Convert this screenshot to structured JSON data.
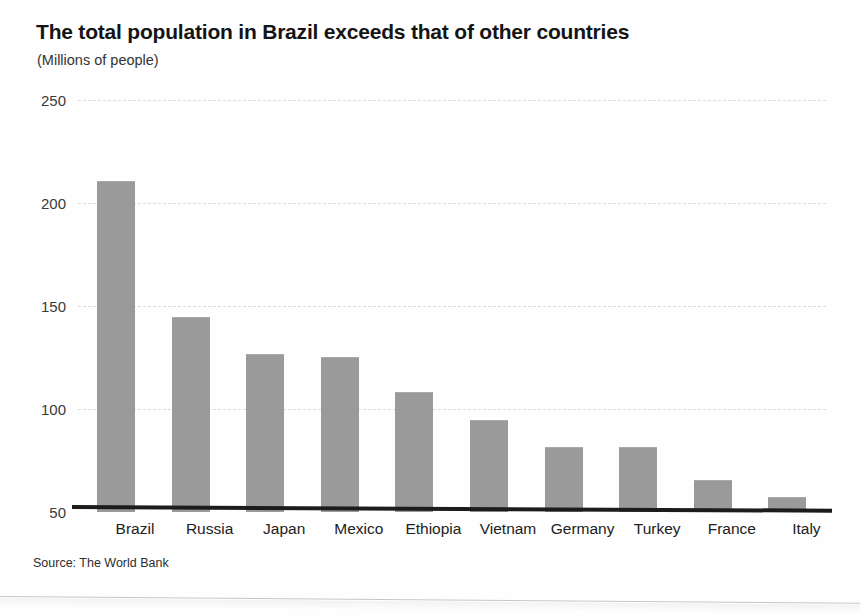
{
  "header": {
    "title": "The total population in Brazil exceeds that of other countries",
    "subtitle": "(Millions of people)"
  },
  "footer": {
    "source": "Source: The World Bank"
  },
  "style": {
    "bar_color": "#9a9a9a",
    "grid_color": "#dcdcdc",
    "axis_color": "#1c1c1c",
    "background": "#fefefe",
    "text_color": "#1a1a1a"
  },
  "chart_data": {
    "type": "bar",
    "title": "The total population in Brazil exceeds that of other countries",
    "subtitle": "(Millions of people)",
    "xlabel": "",
    "ylabel": "",
    "categories": [
      "Brazil",
      "Russia",
      "Japan",
      "Mexico",
      "Ethiopia",
      "Vietnam",
      "Germany",
      "Turkey",
      "France",
      "Italy"
    ],
    "values": [
      210,
      144,
      126,
      125,
      108,
      94,
      81,
      81,
      65,
      57
    ],
    "ylim": [
      50,
      250
    ],
    "yticks": [
      50,
      100,
      150,
      200,
      250
    ],
    "ytick_labels": [
      "50",
      "100",
      "150",
      "200",
      "250"
    ],
    "grid": true,
    "grid_axis": "y",
    "grid_style": "dashed",
    "legend": false,
    "source": "Source: The World Bank",
    "units": "Millions of people"
  }
}
